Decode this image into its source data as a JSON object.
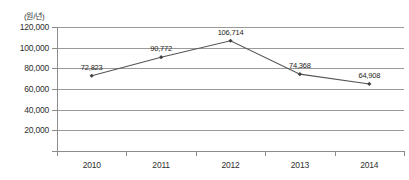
{
  "chart_data": {
    "type": "line",
    "title": "",
    "subtitle": "",
    "unit_label": "(원/년)",
    "xlabel": "",
    "ylabel": "",
    "categories": [
      "2010",
      "2011",
      "2012",
      "2013",
      "2014"
    ],
    "series": [
      {
        "name": "",
        "values": [
          72823,
          90772,
          106714,
          74368,
          64908
        ],
        "point_labels": [
          "72,823",
          "90,772",
          "106,714",
          "74,368",
          "64,908"
        ],
        "line_color": "#555555",
        "marker": "diamond",
        "marker_color": "#404040"
      }
    ],
    "ylim": [
      0,
      120000
    ],
    "yticks": [
      20000,
      40000,
      60000,
      80000,
      100000,
      120000
    ],
    "ytick_labels": [
      "20,000",
      "40,000",
      "60,000",
      "80,000",
      "100,000",
      "120,000"
    ],
    "grid": {
      "horizontal": true,
      "vertical": false,
      "color": "#9a9a9a"
    },
    "legend": {
      "visible": false,
      "position": "none"
    },
    "axis_color": "#8c8c8c",
    "background_color": "#ffffff"
  }
}
